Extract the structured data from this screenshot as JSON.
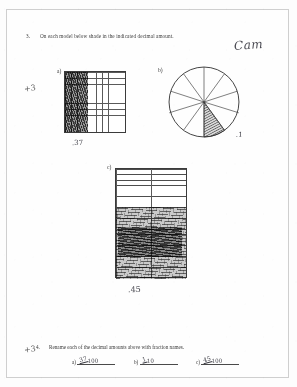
{
  "worksheet": {
    "student_name_handwritten": "Cam",
    "teacher_marks": {
      "top": "+3",
      "bottom": "+3"
    }
  },
  "question3": {
    "number": "3.",
    "prompt": "On each model below shade in the indicated decimal amount.",
    "models": [
      {
        "label": "a)",
        "type": "grid-10x10",
        "columns": 10,
        "rows": 10,
        "shaded_cells": 37,
        "answer_handwritten": ".37"
      },
      {
        "label": "b)",
        "type": "circle-sectors",
        "sectors": 10,
        "shaded_sectors": 1,
        "answer_handwritten": ".1"
      },
      {
        "label": "c)",
        "type": "grid-rectangle",
        "columns": 4,
        "rows": 20,
        "shaded_cells": 45,
        "answer_handwritten": ".45"
      }
    ]
  },
  "question4": {
    "number": "4.",
    "prompt": "Rename each of the decimal amounts above with fraction names.",
    "answers": [
      {
        "label": "a)",
        "numerator": "37",
        "denominator": "100"
      },
      {
        "label": "b)",
        "numerator": "1",
        "denominator": "10"
      },
      {
        "label": "c)",
        "numerator": "45",
        "denominator": "100"
      }
    ]
  }
}
